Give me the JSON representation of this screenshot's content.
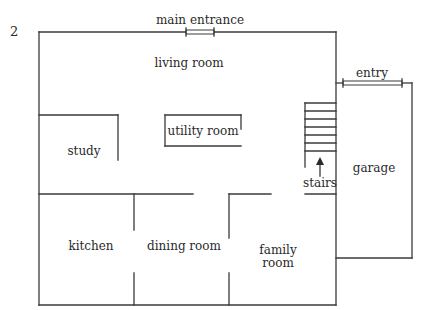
{
  "figure_number": "2",
  "labels": {
    "main_entrance": "main entrance",
    "entry": "entry",
    "living_room": "living room",
    "utility_room": "utility room",
    "study": "study",
    "stairs": "stairs",
    "garage": "garage",
    "kitchen": "kitchen",
    "dining_room": "dining room",
    "family_room_line1": "family",
    "family_room_line2": "room"
  },
  "colors": {
    "wall": "#3a3a3a",
    "text": "#2a2a2a",
    "background": "#ffffff"
  }
}
